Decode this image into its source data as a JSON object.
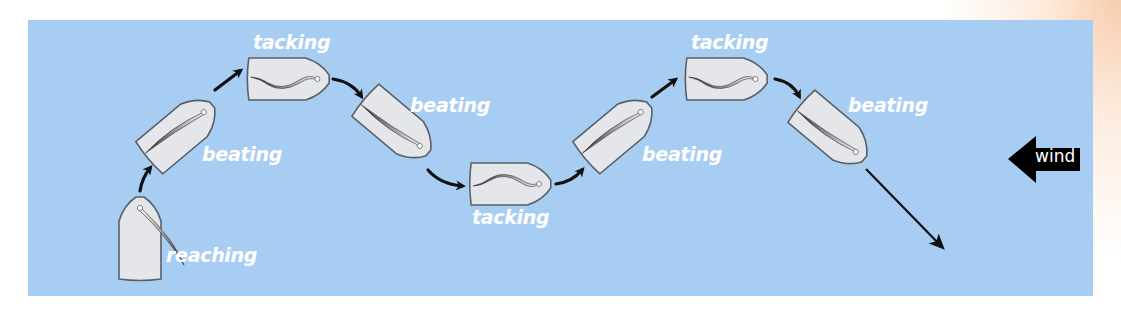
{
  "diagram": {
    "type": "sailing-maneuver-sequence",
    "colors": {
      "water": "#a8cdf2",
      "hull_fill": "#e4e6ea",
      "hull_stroke": "#5a5e66",
      "arrow": "#111111",
      "label": "#ffffff",
      "wind_arrow": "#000000"
    },
    "labels": [
      {
        "id": "reaching",
        "text": "reaching"
      },
      {
        "id": "beating-1",
        "text": "beating"
      },
      {
        "id": "tacking-1",
        "text": "tacking"
      },
      {
        "id": "beating-2",
        "text": "beating"
      },
      {
        "id": "tacking-2",
        "text": "tacking"
      },
      {
        "id": "beating-3",
        "text": "beating"
      },
      {
        "id": "tacking-3",
        "text": "tacking"
      },
      {
        "id": "beating-4",
        "text": "beating"
      }
    ],
    "wind": {
      "label": "wind",
      "direction": "left"
    }
  }
}
